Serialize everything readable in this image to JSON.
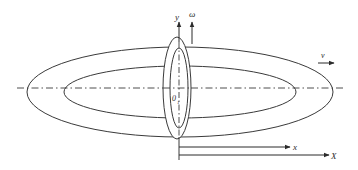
{
  "diagram": {
    "type": "rolling-ring / rotating body schematic",
    "colors": {
      "stroke": "#3a3a3a",
      "background": "#ffffff"
    },
    "labels": {
      "y_axis": "y",
      "omega": "ω",
      "velocity": "v",
      "origin": "0",
      "origin_sub": "1",
      "x_axis": "x",
      "X_axis": "X"
    },
    "elements": [
      {
        "id": "outer-horizontal-ellipse",
        "kind": "ellipse",
        "cx": 180,
        "cy": 92,
        "rx": 153,
        "ry": 45
      },
      {
        "id": "inner-horizontal-ellipse",
        "kind": "ellipse",
        "cx": 180,
        "cy": 92,
        "rx": 116,
        "ry": 26
      },
      {
        "id": "outer-vertical-ellipse",
        "kind": "ellipse",
        "cx": 177,
        "cy": 88,
        "rx": 14,
        "ry": 51
      },
      {
        "id": "inner-vertical-ellipse",
        "kind": "ellipse",
        "cx": 179,
        "cy": 88,
        "rx": 9,
        "ry": 40
      },
      {
        "id": "centerline-horizontal",
        "kind": "dash-dot-line"
      },
      {
        "id": "centerline-vertical",
        "kind": "dash-dot-line"
      },
      {
        "id": "y-arrow",
        "kind": "arrow",
        "direction": "up"
      },
      {
        "id": "omega-arrow",
        "kind": "arrow",
        "direction": "up"
      },
      {
        "id": "v-arrow",
        "kind": "arrow",
        "direction": "right"
      },
      {
        "id": "x-arrow",
        "kind": "arrow",
        "direction": "right"
      },
      {
        "id": "X-arrow",
        "kind": "arrow",
        "direction": "right"
      }
    ]
  }
}
